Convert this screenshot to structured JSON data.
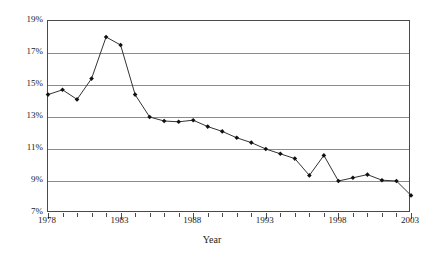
{
  "chart_data": {
    "type": "line",
    "title": "",
    "xlabel": "Year",
    "ylabel": "",
    "x": [
      1978,
      1979,
      1980,
      1981,
      1982,
      1983,
      1984,
      1985,
      1986,
      1987,
      1988,
      1989,
      1990,
      1991,
      1992,
      1993,
      1994,
      1995,
      1996,
      1997,
      1998,
      1999,
      2000,
      2001,
      2002,
      2003
    ],
    "values": [
      14.4,
      14.7,
      14.1,
      15.4,
      18.0,
      17.5,
      14.4,
      13.0,
      12.75,
      12.7,
      12.8,
      12.4,
      12.1,
      11.7,
      11.4,
      11.0,
      10.7,
      10.4,
      9.35,
      10.6,
      9.0,
      9.2,
      9.4,
      9.05,
      9.0,
      8.1
    ],
    "series": [
      {
        "name": "rate",
        "values": [
          14.4,
          14.7,
          14.1,
          15.4,
          18.0,
          17.5,
          14.4,
          13.0,
          12.75,
          12.7,
          12.8,
          12.4,
          12.1,
          11.7,
          11.4,
          11.0,
          10.7,
          10.4,
          9.35,
          10.6,
          9.0,
          9.2,
          9.4,
          9.05,
          9.0,
          8.1
        ]
      }
    ],
    "xlim": [
      1978,
      2003
    ],
    "ylim": [
      7,
      19
    ],
    "ytick_values": [
      7,
      9,
      11,
      13,
      15,
      17,
      19
    ],
    "ytick_labels": [
      "7%",
      "9%",
      "11%",
      "13%",
      "15%",
      "17%",
      "19%"
    ],
    "xtick_values": [
      1978,
      1979,
      1980,
      1981,
      1982,
      1983,
      1984,
      1985,
      1986,
      1987,
      1988,
      1989,
      1990,
      1991,
      1992,
      1993,
      1994,
      1995,
      1996,
      1997,
      1998,
      1999,
      2000,
      2001,
      2002,
      2003
    ],
    "xtick_labels_shown": [
      {
        "value": 1978,
        "label": "1978"
      },
      {
        "value": 1983,
        "label": "1983"
      },
      {
        "value": 1988,
        "label": "1988"
      },
      {
        "value": 1993,
        "label": "1993"
      },
      {
        "value": 1998,
        "label": "1998"
      },
      {
        "value": 2003,
        "label": "2003"
      }
    ],
    "grid": true,
    "grid_axis": "y",
    "legend": false,
    "legend_position": "none",
    "marker": "diamond",
    "colors": {
      "line": "#333333",
      "marker": "#111111",
      "gridline": "#8c8c8c",
      "frame": "#4a4a4a",
      "text": "#1a1a1a",
      "background": "#ffffff"
    }
  }
}
